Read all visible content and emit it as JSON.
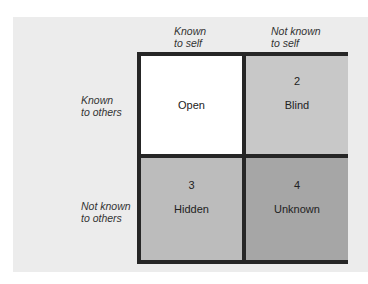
{
  "diagram": {
    "columns": [
      {
        "line1": "Known",
        "line2": "to self"
      },
      {
        "line1": "Not known",
        "line2": "to self"
      }
    ],
    "rows": [
      {
        "line1": "Known",
        "line2": "to others"
      },
      {
        "line1": "Not known",
        "line2": "to others"
      }
    ],
    "cells": [
      {
        "number": "",
        "name": "Open",
        "color": "#ffffff"
      },
      {
        "number": "2",
        "name": "Blind",
        "color": "#c8c8c8"
      },
      {
        "number": "3",
        "name": "Hidden",
        "color": "#bcbcbc"
      },
      {
        "number": "4",
        "name": "Unknown",
        "color": "#a6a6a6"
      }
    ],
    "colors": {
      "background": "#ececec",
      "border": "#262626"
    }
  }
}
